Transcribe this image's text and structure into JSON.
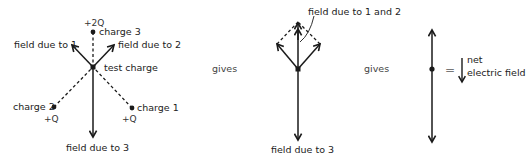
{
  "figure": {
    "left_diagram": {
      "charge3_value": "+2Q",
      "charge3_label": "charge 3",
      "field1_label": "field due to 1",
      "field2_label": "field due to 2",
      "test_charge_label": "test charge",
      "charge2_label": "charge 2",
      "charge2_value": "+Q",
      "charge1_label": "charge 1",
      "charge1_value": "+Q",
      "field3_label": "field due to 3"
    },
    "gives_1": "gives",
    "middle_diagram": {
      "field12_label": "field due to 1 and 2",
      "field3_label": "field due to 3"
    },
    "gives_2": "gives",
    "right_diagram": {
      "equals": "=",
      "net_label_line1": "net",
      "net_label_line2": "electric field"
    },
    "colors": {
      "stroke": "#1a1a1a",
      "text": "#222222"
    }
  }
}
